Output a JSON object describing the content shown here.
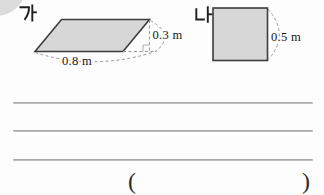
{
  "colors": {
    "shape_fill": "#d7d7d7",
    "shape_stroke": "#3d3d3d",
    "dash_stroke": "#979797",
    "rule_line": "#adadad",
    "text_color": "#161616"
  },
  "figure_ga": {
    "label": "가",
    "shape": "parallelogram",
    "base_label": "0.8 m",
    "height_label": "0.3 m"
  },
  "figure_na": {
    "label": "나",
    "shape": "square",
    "side_label": "0.5 m"
  },
  "answer": {
    "open_paren": "(",
    "close_paren": ")"
  }
}
